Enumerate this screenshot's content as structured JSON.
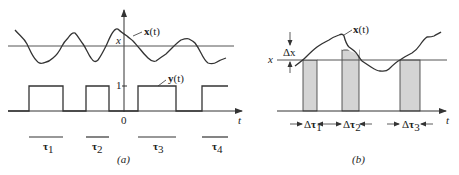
{
  "panel_a": {
    "caption": "(a)",
    "signal_label": "x(t)",
    "signal_label_bold": "x",
    "signal_label_arg": "(t)",
    "indicator_label_bold": "y",
    "indicator_label_arg": "(t)",
    "level_label": "x",
    "one_label": "1",
    "origin_label": "0",
    "time_axis_label": "t",
    "intervals": [
      {
        "symbol": "τ",
        "sub": "1"
      },
      {
        "symbol": "τ",
        "sub": "2"
      },
      {
        "symbol": "τ",
        "sub": "3"
      },
      {
        "symbol": "τ",
        "sub": "4"
      }
    ]
  },
  "panel_b": {
    "caption": "(b)",
    "signal_label_bold": "x",
    "signal_label_arg": "(t)",
    "level_label": "x",
    "delta_x_label": "Δx",
    "time_axis_label": "t",
    "intervals": [
      {
        "prefix": "Δ",
        "symbol": "τ",
        "sub": "1"
      },
      {
        "prefix": "Δ",
        "symbol": "τ",
        "sub": "2"
      },
      {
        "prefix": "Δ",
        "symbol": "τ",
        "sub": "3"
      }
    ],
    "shade_color": "#d4d4d4"
  },
  "colors": {
    "line": "#333333",
    "level_line": "#555555"
  }
}
